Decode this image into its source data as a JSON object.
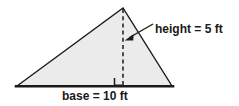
{
  "figure": {
    "type": "geometry-diagram",
    "shape": "triangle",
    "background_color": "#ffffff",
    "fill_color": "#ebebeb",
    "stroke_color": "#1a1a1a",
    "labels": {
      "height": "height = 5 ft",
      "base": "base = 10 ft"
    },
    "measurements": {
      "base_value": 10,
      "base_unit": "ft",
      "height_value": 5,
      "height_unit": "ft"
    },
    "annotations": {
      "right_angle_marker": "right-angle",
      "altitude_style": "dashed",
      "pointer": "arrow"
    },
    "geometry": {
      "vertex_left": [
        17,
        86
      ],
      "vertex_apex": [
        123,
        8
      ],
      "vertex_right": [
        172,
        86
      ],
      "altitude_foot": [
        123,
        86
      ],
      "arrow_tail": [
        153,
        24
      ],
      "arrow_tip": [
        125,
        40
      ]
    }
  }
}
